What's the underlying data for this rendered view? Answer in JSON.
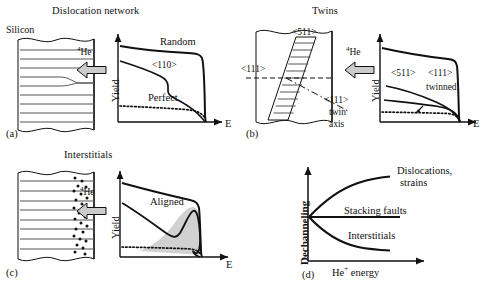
{
  "figure": {
    "caption_domain": "ion channeling yield spectra for defect types in silicon",
    "panels": [
      {
        "tag": "(a)",
        "title": "Dislocation network",
        "material_label": "Silicon",
        "beam_label": "He",
        "beam_mass": "4",
        "defect_type": "dislocation-network",
        "chart": {
          "xlabel": "E",
          "ylabel": "Yield",
          "curves": [
            {
              "name": "Random",
              "label": "Random",
              "style": "solid"
            },
            {
              "name": "aligned",
              "label": "<110>",
              "style": "solid"
            },
            {
              "name": "perfect",
              "label": "Perfect",
              "style": "dotted"
            }
          ]
        }
      },
      {
        "tag": "(b)",
        "title": "Twins",
        "beam_label": "He",
        "beam_mass": "4",
        "defect_type": "twins",
        "diagram_labels": {
          "band_direction": "<511>",
          "incident_direction": "<111>",
          "twin_axis_line1": "<111>",
          "twin_axis_line2": "twin",
          "twin_axis_line3": "axis"
        },
        "chart": {
          "xlabel": "E",
          "ylabel": "Yield",
          "curves": [
            {
              "name": "Random",
              "label": "",
              "style": "solid"
            },
            {
              "name": "511-aligned",
              "label": "<511>",
              "style": "solid"
            },
            {
              "name": "111-aligned",
              "label": "<111>",
              "style": "solid"
            },
            {
              "name": "twinned",
              "label": "twinned",
              "style": "solid"
            },
            {
              "name": "perfect",
              "label": "",
              "style": "dotted"
            }
          ]
        }
      },
      {
        "tag": "(c)",
        "title": "Interstitials",
        "beam_label": "He",
        "beam_mass": "4",
        "defect_type": "interstitials",
        "chart": {
          "xlabel": "E",
          "ylabel": "Yield",
          "curves": [
            {
              "name": "Random",
              "label": "",
              "style": "solid"
            },
            {
              "name": "aligned",
              "label": "Aligned",
              "style": "solid"
            },
            {
              "name": "perfect",
              "label": "",
              "style": "dotted"
            }
          ],
          "shaded_region": "interstitial-peak"
        }
      },
      {
        "tag": "(d)",
        "title": "",
        "chart": {
          "xlabel": "He",
          "xlabel_sup": "+",
          "xlabel_tail": " energy",
          "ylabel": "Dechanneling",
          "curves": [
            {
              "name": "dislocations",
              "label_line1": "Dislocations,",
              "label_line2": "strains",
              "trend": "increasing"
            },
            {
              "name": "stacking-faults",
              "label_line1": "Stacking faults",
              "label_line2": "",
              "trend": "flat"
            },
            {
              "name": "interstitials",
              "label_line1": "Interstitials",
              "label_line2": "",
              "trend": "decreasing"
            }
          ]
        }
      }
    ]
  },
  "colors": {
    "ink": "#111111",
    "lattice_line": "#555555",
    "arrow_fill": "#cccccc",
    "shade_fill": "#c9c9c9"
  }
}
